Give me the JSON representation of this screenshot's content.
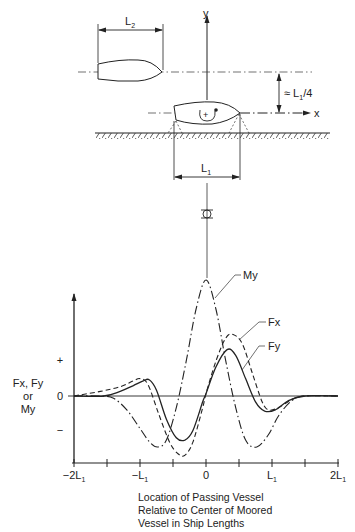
{
  "schematic": {
    "passing_vessel_label": "L",
    "passing_vessel_sub": "2",
    "moored_vessel_label": "L",
    "moored_vessel_sub": "1",
    "separation_label": "≈ L",
    "separation_sub": "1",
    "separation_suffix": "/4",
    "y_axis_label": "y",
    "x_axis_label": "x",
    "moment_sign": "+"
  },
  "chart_data": {
    "type": "line",
    "title": "",
    "xlabel": "Location of Passing Vessel Relative to Center of Moored Vessel in Ship Lengths",
    "ylabel": "Fx, Fy or My",
    "ylabel_lines": [
      "Fx, Fy",
      "or",
      "My"
    ],
    "xlim": [
      -2,
      2
    ],
    "ylim": [
      -0.6,
      1.0
    ],
    "x_ticks": [
      -2,
      -1.5,
      -1,
      -0.5,
      0,
      0.5,
      1,
      1.5,
      2
    ],
    "x_tick_labels": [
      {
        "x": -2,
        "main": "−2L",
        "sub": "1"
      },
      {
        "x": -1,
        "main": "−L",
        "sub": "1"
      },
      {
        "x": 0,
        "main": "0",
        "sub": ""
      },
      {
        "x": 1,
        "main": "L",
        "sub": "1"
      },
      {
        "x": 2,
        "main": "2L",
        "sub": "1"
      }
    ],
    "y_tick_labels": [
      {
        "y": 0.31,
        "label": "+"
      },
      {
        "y": 0,
        "label": "0"
      },
      {
        "y": -0.29,
        "label": "−"
      }
    ],
    "series": [
      {
        "name": "My",
        "style": "dash-dot",
        "x": [
          -2,
          -1.6,
          -1.4,
          -1.2,
          -1.0,
          -0.85,
          -0.73,
          -0.6,
          -0.45,
          -0.3,
          -0.15,
          0,
          0.15,
          0.3,
          0.45,
          0.6,
          0.77,
          0.95,
          1.1,
          1.3,
          1.5,
          2
        ],
        "y": [
          0,
          0,
          -0.02,
          -0.12,
          -0.28,
          -0.4,
          -0.44,
          -0.38,
          -0.1,
          0.3,
          0.75,
          1.0,
          0.75,
          0.3,
          -0.1,
          -0.38,
          -0.44,
          -0.33,
          -0.17,
          -0.04,
          0,
          0
        ]
      },
      {
        "name": "Fx",
        "style": "dashed",
        "x": [
          -2,
          -1.6,
          -1.3,
          -1.1,
          -1.0,
          -0.88,
          -0.72,
          -0.55,
          -0.42,
          -0.32,
          -0.2,
          -0.05,
          0,
          0.15,
          0.3,
          0.41,
          0.55,
          0.7,
          0.85,
          0.95,
          1.1,
          1.3,
          1.5,
          2
        ],
        "y": [
          0,
          0.04,
          0.08,
          0.13,
          0.15,
          0.1,
          -0.15,
          -0.4,
          -0.5,
          -0.51,
          -0.4,
          -0.1,
          0.02,
          0.3,
          0.5,
          0.53,
          0.45,
          0.2,
          -0.05,
          -0.12,
          -0.1,
          -0.03,
          0,
          0
        ]
      },
      {
        "name": "Fy",
        "style": "solid",
        "x": [
          -2,
          -1.55,
          -1.3,
          -1.1,
          -0.95,
          -0.86,
          -0.75,
          -0.6,
          -0.45,
          -0.32,
          -0.2,
          -0.05,
          0,
          0.15,
          0.32,
          0.45,
          0.6,
          0.75,
          0.89,
          1.05,
          1.25,
          1.5,
          2
        ],
        "y": [
          0,
          0,
          0.04,
          0.09,
          0.13,
          0.14,
          0.05,
          -0.2,
          -0.36,
          -0.38,
          -0.3,
          -0.05,
          0.02,
          0.25,
          0.4,
          0.35,
          0.15,
          -0.05,
          -0.13,
          -0.12,
          -0.04,
          0,
          0
        ]
      }
    ],
    "annotations": [
      "My",
      "Fx",
      "Fy"
    ]
  },
  "caption_lines": [
    "Location of Passing Vessel",
    "Relative to Center of Moored",
    "Vessel in Ship Lengths"
  ]
}
